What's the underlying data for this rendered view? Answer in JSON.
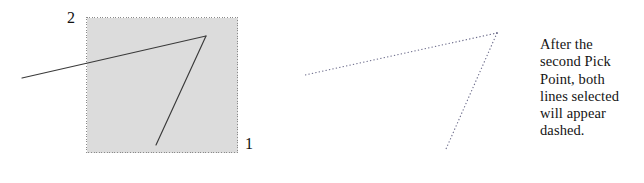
{
  "figure": {
    "background_color": "#ffffff",
    "line_color": "#3a3a3a",
    "dashed_line_color": "#6b6b8a",
    "selection_box": {
      "fill_color": "#dcdcdc",
      "border_color": "#8a8a8a",
      "border_style": "dotted",
      "x": 86,
      "y": 17,
      "width": 152,
      "height": 136
    },
    "corner_labels": [
      {
        "name": "pick-point-2",
        "text": "2",
        "x": 67,
        "y": 10
      },
      {
        "name": "pick-point-1",
        "text": "1",
        "x": 245,
        "y": 136
      }
    ],
    "solid_lines": [
      {
        "name": "shallow-line",
        "x1": 22,
        "y1": 78,
        "x2": 206,
        "y2": 36
      },
      {
        "name": "steep-line",
        "x1": 156,
        "y1": 145,
        "x2": 206,
        "y2": 36
      }
    ],
    "dashed_lines": [
      {
        "name": "shallow-line-dashed",
        "x1": 305,
        "y1": 75,
        "x2": 497,
        "y2": 33
      },
      {
        "name": "steep-line-dashed",
        "x1": 446,
        "y1": 149,
        "x2": 497,
        "y2": 33
      }
    ]
  },
  "caption": {
    "full_text": "After the second Pick Point, both lines selected will appear dashed.",
    "lines": [
      "After the",
      "second Pick",
      "Point, both",
      "lines selected",
      "will appear",
      "dashed."
    ]
  }
}
